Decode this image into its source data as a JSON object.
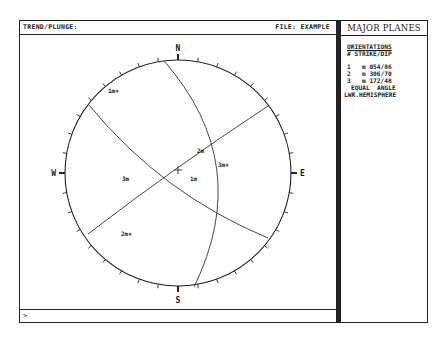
{
  "header": {
    "left_label": "TREND/PLUNGE:",
    "file_label": "FILE: EXAMPLE"
  },
  "side_panel": {
    "title": "MAJOR PLANES",
    "section_title": "ORIENTATIONS",
    "column_header": "# STRIKE/DIP",
    "planes": [
      {
        "num": "1",
        "mark": "m",
        "orientation": "054/86"
      },
      {
        "num": "2",
        "mark": "m",
        "orientation": "306/70"
      },
      {
        "num": "3",
        "mark": "m",
        "orientation": "172/48"
      }
    ],
    "projection_line1": "EQUAL  ANGLE",
    "projection_line2": "LWR.HEMISPHERE"
  },
  "command_line": {
    "prompt": ">",
    "value": ""
  },
  "stereonet": {
    "center": [
      178,
      173
    ],
    "radius": 113,
    "tick_interval_deg": 10,
    "cardinals": {
      "N": "N",
      "E": "E",
      "S": "S",
      "W": "W"
    },
    "center_mark": "+",
    "great_circles": [
      {
        "id": "1",
        "start": [
          268,
          106
        ],
        "end": [
          88,
          234
        ],
        "bulge": 2
      },
      {
        "id": "2",
        "start": [
          89,
          105
        ],
        "end": [
          268,
          238
        ],
        "bulge": 14
      },
      {
        "id": "3",
        "start": [
          164,
          61
        ],
        "end": [
          194,
          287
        ],
        "bulge": -38
      }
    ],
    "labels": [
      {
        "text": "1m+",
        "x": 108,
        "y": 93
      },
      {
        "text": "2m",
        "x": 197,
        "y": 153
      },
      {
        "text": "3m+",
        "x": 218,
        "y": 167
      },
      {
        "text": "3m",
        "x": 122,
        "y": 181
      },
      {
        "text": "1m",
        "x": 190,
        "y": 181
      },
      {
        "text": "2m+",
        "x": 121,
        "y": 236
      }
    ]
  }
}
